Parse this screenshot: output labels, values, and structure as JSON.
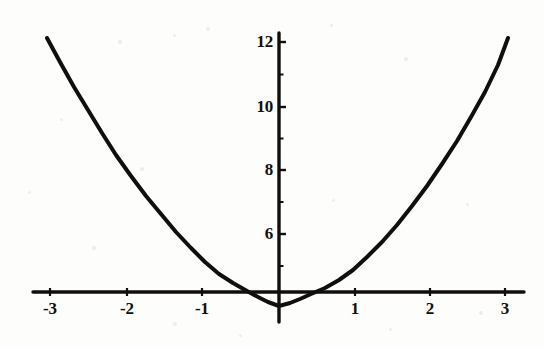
{
  "figure": {
    "background_color": "#fdfdfc",
    "ink_color": "#100f0d",
    "width": 544,
    "height": 347
  },
  "chart_data": {
    "type": "line",
    "title": "",
    "subtitle": "",
    "xlabel": "",
    "ylabel": "",
    "function": "y = x^2 - 1",
    "grid": false,
    "legend": false,
    "legend_position": "none",
    "xlim": [
      -3.2,
      3.2
    ],
    "ylim": [
      -1,
      12.6
    ],
    "xticks": [
      -3,
      -2,
      -1,
      1,
      2,
      3
    ],
    "xtick_labels": [
      "-3",
      "-2",
      "-1",
      "1",
      "2",
      "3"
    ],
    "yticks": [
      6,
      8,
      10,
      12
    ],
    "ytick_labels": [
      "6",
      "8",
      "10",
      "12"
    ],
    "y_minor_ticks": [
      5,
      7,
      9,
      11
    ],
    "x_axis_value": 0,
    "y_axis_value": 0,
    "x_intercepts": [
      -1,
      1
    ],
    "vertex": [
      0,
      -1
    ],
    "series": [
      {
        "name": "y = x^2 - 1",
        "color": "#100f0d",
        "line_width": 4,
        "x": [
          -3,
          -2.8,
          -2.6,
          -2.4,
          -2.2,
          -2,
          -1.8,
          -1.6,
          -1.4,
          -1.2,
          -1,
          -0.8,
          -0.6,
          -0.4,
          -0.2,
          0,
          0.2,
          0.4,
          0.6,
          0.8,
          1,
          1.2,
          1.4,
          1.6,
          1.8,
          2,
          2.2,
          2.4,
          2.6,
          2.8,
          3
        ],
        "values": [
          8,
          6.84,
          5.76,
          4.76,
          3.84,
          3,
          2.24,
          1.56,
          0.96,
          0.44,
          0,
          -0.36,
          -0.64,
          -0.84,
          -0.96,
          -1,
          -0.96,
          -0.84,
          -0.64,
          -0.36,
          0,
          0.44,
          0.96,
          1.56,
          2.24,
          3,
          3.84,
          4.76,
          5.76,
          6.84,
          8
        ]
      }
    ]
  },
  "axes": {
    "x_axis_name": "horizontal-axis",
    "y_axis_name": "vertical-axis",
    "x_tick_positions_px": [
      50,
      127,
      202,
      355,
      430,
      505
    ],
    "y_tick_positions_px": [
      234,
      170,
      107,
      42
    ],
    "origin_px": [
      279,
      292
    ]
  },
  "curve_points_px": [
    [
      47,
      38
    ],
    [
      60,
      62
    ],
    [
      74,
      87
    ],
    [
      88,
      110
    ],
    [
      102,
      133
    ],
    [
      116,
      155
    ],
    [
      131,
      176
    ],
    [
      146,
      196
    ],
    [
      161,
      214
    ],
    [
      176,
      232
    ],
    [
      191,
      248
    ],
    [
      205,
      262
    ],
    [
      219,
      274
    ],
    [
      233,
      283
    ],
    [
      247,
      291
    ],
    [
      258,
      297
    ],
    [
      268,
      302
    ],
    [
      279,
      306
    ],
    [
      290,
      303
    ],
    [
      300,
      299
    ],
    [
      311,
      294
    ],
    [
      325,
      288
    ],
    [
      339,
      280
    ],
    [
      353,
      270
    ],
    [
      367,
      257
    ],
    [
      382,
      242
    ],
    [
      397,
      225
    ],
    [
      412,
      206
    ],
    [
      427,
      186
    ],
    [
      442,
      164
    ],
    [
      457,
      141
    ],
    [
      471,
      117
    ],
    [
      485,
      92
    ],
    [
      498,
      65
    ],
    [
      508,
      38
    ]
  ],
  "specks": [
    {
      "x": 118,
      "y": 40,
      "r": 2
    },
    {
      "x": 173,
      "y": 34,
      "r": 1.5
    },
    {
      "x": 206,
      "y": 27,
      "r": 2
    },
    {
      "x": 330,
      "y": 24,
      "r": 1.5
    },
    {
      "x": 404,
      "y": 57,
      "r": 2
    },
    {
      "x": 60,
      "y": 118,
      "r": 1.5
    },
    {
      "x": 140,
      "y": 167,
      "r": 2
    },
    {
      "x": 466,
      "y": 203,
      "r": 1.5
    },
    {
      "x": 92,
      "y": 246,
      "r": 2
    },
    {
      "x": 332,
      "y": 199,
      "r": 1.5
    },
    {
      "x": 173,
      "y": 322,
      "r": 2
    },
    {
      "x": 389,
      "y": 328,
      "r": 1.5
    },
    {
      "x": 479,
      "y": 311,
      "r": 2
    },
    {
      "x": 239,
      "y": 334,
      "r": 1.5
    },
    {
      "x": 28,
      "y": 191,
      "r": 1.5
    }
  ]
}
